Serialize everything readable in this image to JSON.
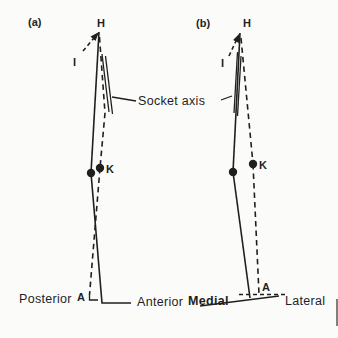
{
  "diagram": {
    "socket_axis_label": "Socket axis",
    "panels": {
      "a": {
        "tag": "(a)",
        "hip": "H",
        "reference": "I",
        "knee": "K",
        "ankle": "A",
        "dir_left": "Posterior",
        "dir_right": "Anterior"
      },
      "b": {
        "tag": "(b)",
        "hip": "H",
        "reference": "I",
        "knee": "K",
        "ankle": "A",
        "dir_left": "Medial",
        "dir_right": "Lateral"
      }
    },
    "colors": {
      "ink": "#1f1f1f",
      "paper": "#fbfbf9"
    }
  }
}
